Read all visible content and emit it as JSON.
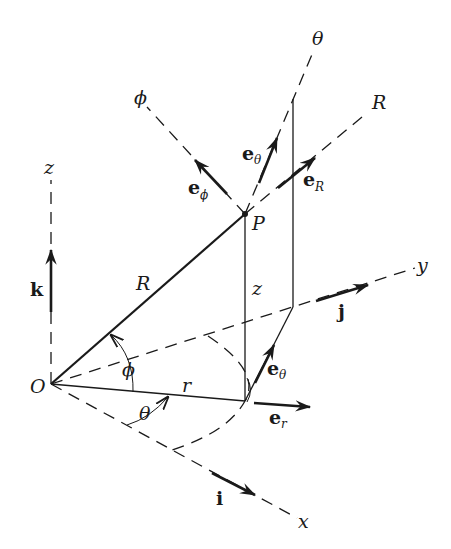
{
  "diagram": {
    "points": {
      "origin": {
        "label": "O",
        "x": 51,
        "y": 384
      },
      "P": {
        "label": "P",
        "x": 245,
        "y": 214
      },
      "foot": {
        "x": 245,
        "y": 401
      },
      "proj_top": {
        "x": 293,
        "y": 99
      },
      "proj_bottom": {
        "x": 293,
        "y": 307
      }
    },
    "axes": {
      "x": {
        "label": "x",
        "end": [
          297,
          518
        ]
      },
      "y": {
        "label": "y",
        "end": [
          415,
          268
        ]
      },
      "z": {
        "label": "z",
        "end": [
          51,
          180
        ]
      }
    },
    "direction_lines": {
      "phi": {
        "label": "ϕ",
        "end": [
          147,
          107
        ]
      },
      "theta": {
        "label": "θ",
        "end": [
          313,
          52
        ]
      },
      "R": {
        "label": "R",
        "end": [
          368,
          112
        ]
      }
    },
    "segment_labels": {
      "R": "R",
      "z": "z",
      "r": "r",
      "phi_angle": "ϕ",
      "theta_angle": "θ"
    },
    "unit_vectors": [
      {
        "name": "k",
        "base": "k",
        "sub": ""
      },
      {
        "name": "j",
        "base": "j",
        "sub": ""
      },
      {
        "name": "i",
        "base": "i",
        "sub": ""
      },
      {
        "name": "e_phi",
        "base": "e",
        "sub": "ϕ"
      },
      {
        "name": "e_theta_upper",
        "base": "e",
        "sub": "θ"
      },
      {
        "name": "e_R",
        "base": "e",
        "sub": "R"
      },
      {
        "name": "e_theta_lower",
        "base": "e",
        "sub": "θ"
      },
      {
        "name": "e_r",
        "base": "e",
        "sub": "r"
      }
    ]
  }
}
